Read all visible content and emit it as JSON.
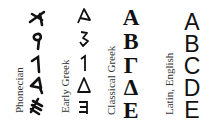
{
  "diagram": {
    "title": "",
    "columns": [
      {
        "label": "Phonecian",
        "glyphs": [
          "𐤀",
          "𐤁",
          "𐤂",
          "𐤃",
          "𐤄"
        ],
        "fallback": [
          "≮",
          "9",
          "1",
          "◁",
          "ᗰ"
        ]
      },
      {
        "label": "Early Greek",
        "glyphs": [
          "A",
          "ϐ",
          "1",
          "Δ",
          "ꟻ"
        ]
      },
      {
        "label": "Classical Greek",
        "glyphs": [
          "Α",
          "Β",
          "Γ",
          "Δ",
          "Ε"
        ]
      },
      {
        "label": "Latin, English",
        "glyphs": [
          "A",
          "B",
          "C",
          "D",
          "E"
        ]
      }
    ],
    "rows": [
      "alpha/aleph",
      "beta/beth",
      "gamma/gimel",
      "delta/daleth",
      "epsilon/he"
    ]
  }
}
